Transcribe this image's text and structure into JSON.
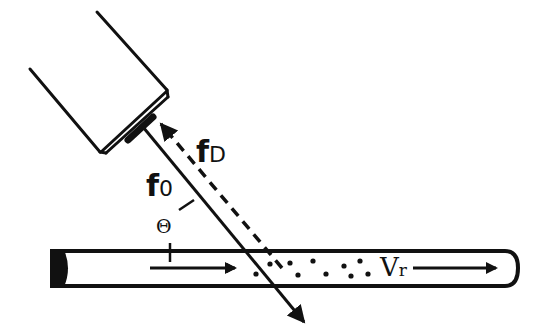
{
  "diagram": {
    "labels": {
      "transmitted_freq": "f",
      "transmitted_freq_sub": "0",
      "doppler_freq": "f",
      "doppler_freq_sub": "D",
      "angle": "Θ",
      "velocity": "V",
      "velocity_sub": "r"
    },
    "elements": {
      "transducer": "ultrasound probe",
      "transmitted_beam": "solid arrow, probe → vessel",
      "reflected_beam": "dashed arrow, vessel → probe",
      "vessel": "blood vessel (tube)",
      "flow_arrow_left": "flow direction arrow",
      "flow_arrow_right": "flow direction arrow",
      "particles": "red blood cells (dots)"
    },
    "colors": {
      "stroke": "#111111",
      "background": "#ffffff"
    }
  }
}
